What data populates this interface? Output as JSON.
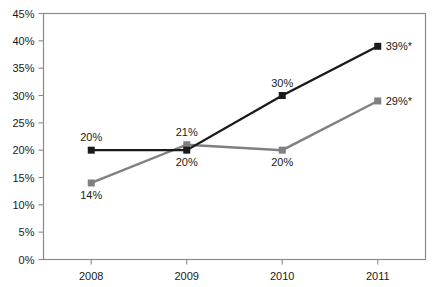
{
  "chart_data": {
    "type": "line",
    "title": "",
    "subtitle": "",
    "xlabel": "",
    "ylabel": "",
    "categories": [
      "2008",
      "2009",
      "2010",
      "2011"
    ],
    "ylim": [
      0,
      45
    ],
    "ytick_values": [
      0,
      5,
      10,
      15,
      20,
      25,
      30,
      35,
      40,
      45
    ],
    "ytick_labels": [
      "0%",
      "5%",
      "10%",
      "15%",
      "20%",
      "25%",
      "30%",
      "35%",
      "40%",
      "45%"
    ],
    "grid": false,
    "legend": "none",
    "series": [
      {
        "name": "black-series",
        "color": "#1a1a1a",
        "marker": "square",
        "values": [
          20,
          20,
          30,
          39
        ],
        "labels": [
          "20%",
          "20%",
          "30%",
          "39%*"
        ],
        "label_positions": [
          "above",
          "below",
          "above",
          "right"
        ]
      },
      {
        "name": "gray-series",
        "color": "#808080",
        "marker": "square",
        "values": [
          14,
          21,
          20,
          29
        ],
        "labels": [
          "14%",
          "21%",
          "20%",
          "29%*"
        ],
        "label_positions": [
          "below",
          "above",
          "below",
          "right"
        ]
      }
    ],
    "annotations": [
      "39%*",
      "29%*"
    ],
    "background_color": "#ffffff",
    "border_color": "#8a8a8a"
  }
}
